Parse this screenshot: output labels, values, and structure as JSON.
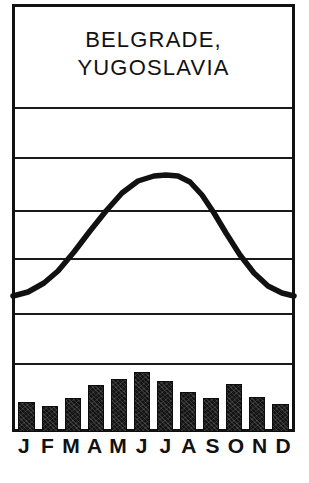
{
  "chart_data": {
    "type": "bar",
    "title": "BELGRADE, YUGOSLAVIA",
    "title_lines": [
      "BELGRADE,",
      "YUGOSLAVIA"
    ],
    "subtitle": "",
    "xlabel": "",
    "ylabel": "",
    "categories": [
      "J",
      "F",
      "M",
      "A",
      "M",
      "J",
      "J",
      "A",
      "S",
      "O",
      "N",
      "D"
    ],
    "month_names": [
      "January",
      "February",
      "March",
      "April",
      "May",
      "June",
      "July",
      "August",
      "September",
      "October",
      "November",
      "December"
    ],
    "grid": true,
    "grid_line_count": 6,
    "legend": "none",
    "series": [
      {
        "name": "Precipitation",
        "type": "bar",
        "values": [
          30,
          26,
          34,
          47,
          53,
          61,
          50,
          40,
          34,
          48,
          35,
          28
        ],
        "ylim": [
          0,
          90
        ],
        "color": "#141414"
      },
      {
        "name": "Temperature",
        "type": "line",
        "values": [
          0.5,
          2.5,
          7.0,
          12.5,
          17.5,
          21.0,
          23.0,
          22.5,
          18.5,
          13.0,
          7.0,
          2.0
        ],
        "ylim": [
          -10,
          40
        ],
        "color": "#111111"
      }
    ]
  },
  "chart": {
    "title_lines": [
      "BELGRADE,",
      "YUGOSLAVIA"
    ],
    "months": [
      "J",
      "F",
      "M",
      "A",
      "M",
      "J",
      "J",
      "A",
      "S",
      "O",
      "N",
      "D"
    ],
    "precip_bar_tops_px": [
      402,
      406,
      398,
      385,
      379,
      372,
      381,
      392,
      398,
      384,
      397,
      404
    ],
    "precip_baseline_px": 432,
    "gridlines_px": [
      107,
      157,
      210,
      258,
      313,
      363
    ],
    "temp_curve_points": "13,296 28,292 44,283 58,271 74,252 90,231 106,211 122,193 138,181 154,176 166,175 178,176 190,182 202,195 214,213 226,233 240,255 254,273 268,286 282,293 294,296",
    "frame_color": "#111111",
    "bar_color": "#141414",
    "line_color": "#111111",
    "background": "#ffffff"
  }
}
